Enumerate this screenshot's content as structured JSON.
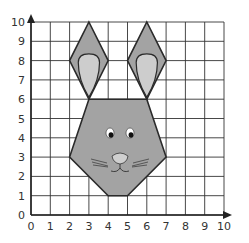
{
  "grid": {
    "x_min": 0,
    "x_max": 10,
    "y_min": 0,
    "y_max": 10,
    "x_ticks": [
      "0",
      "1",
      "2",
      "3",
      "4",
      "5",
      "6",
      "7",
      "8",
      "9",
      "10"
    ],
    "y_ticks": [
      "0",
      "1",
      "2",
      "3",
      "4",
      "5",
      "6",
      "7",
      "8",
      "9",
      "10"
    ]
  },
  "colors": {
    "grid_line": "#333333",
    "axis": "#222222",
    "shape_fill": "#a3a3a3",
    "inner_ear_fill": "#cdcdcd",
    "outline": "#2a2a2a",
    "nose_fill": "#cfcfcf"
  },
  "shapes": {
    "left_ear": [
      [
        3,
        10
      ],
      [
        4,
        8
      ],
      [
        3,
        6
      ],
      [
        2,
        8
      ]
    ],
    "right_ear": [
      [
        6,
        10
      ],
      [
        7,
        8
      ],
      [
        6,
        6
      ],
      [
        5,
        8
      ]
    ],
    "head": [
      [
        3,
        6
      ],
      [
        6,
        6
      ],
      [
        7,
        3
      ],
      [
        5,
        1
      ],
      [
        4,
        1
      ],
      [
        2,
        3
      ]
    ]
  },
  "chart_data": {
    "type": "diagram",
    "title": "",
    "xlabel": "",
    "ylabel": "",
    "xlim": [
      0,
      10
    ],
    "ylim": [
      0,
      10
    ],
    "grid": true,
    "polygons": [
      {
        "name": "left_ear",
        "vertices": [
          [
            3,
            10
          ],
          [
            4,
            8
          ],
          [
            3,
            6
          ],
          [
            2,
            8
          ]
        ]
      },
      {
        "name": "right_ear",
        "vertices": [
          [
            6,
            10
          ],
          [
            7,
            8
          ],
          [
            6,
            6
          ],
          [
            5,
            8
          ]
        ]
      },
      {
        "name": "head",
        "vertices": [
          [
            3,
            6
          ],
          [
            6,
            6
          ],
          [
            7,
            3
          ],
          [
            5,
            1
          ],
          [
            4,
            1
          ],
          [
            2,
            3
          ]
        ]
      }
    ]
  }
}
